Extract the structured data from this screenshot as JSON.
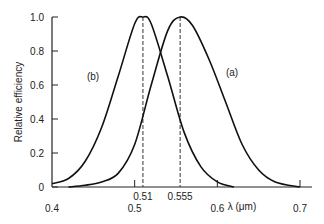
{
  "chart_data": {
    "type": "line",
    "title": "",
    "xlabel": "λ (μm)",
    "ylabel": "Relative efficiency",
    "xlim": [
      0.4,
      0.7
    ],
    "ylim": [
      0,
      1.0
    ],
    "grid": false,
    "x_ticks": [
      {
        "value": 0.4,
        "label": "0.4"
      },
      {
        "value": 0.5,
        "label": "0.5"
      },
      {
        "value": 0.6,
        "label": "0.6"
      },
      {
        "value": 0.7,
        "label": "0.7"
      }
    ],
    "y_ticks": [
      {
        "value": 0,
        "label": "0"
      },
      {
        "value": 0.2,
        "label": "0.2"
      },
      {
        "value": 0.4,
        "label": "0.4"
      },
      {
        "value": 0.6,
        "label": "0.6"
      },
      {
        "value": 0.8,
        "label": "0.8"
      },
      {
        "value": 1.0,
        "label": "1.0"
      }
    ],
    "annotations": [
      {
        "type": "dashed-vline",
        "x": 0.51,
        "label": "0.51"
      },
      {
        "type": "dashed-vline",
        "x": 0.555,
        "label": "0.555"
      }
    ],
    "series": [
      {
        "name": "(b)",
        "peak": 0.51,
        "x": [
          0.4,
          0.42,
          0.44,
          0.46,
          0.48,
          0.5,
          0.51,
          0.52,
          0.54,
          0.56,
          0.58,
          0.6,
          0.62
        ],
        "values": [
          0.02,
          0.05,
          0.15,
          0.35,
          0.65,
          0.96,
          1.0,
          0.96,
          0.65,
          0.32,
          0.12,
          0.03,
          0.0
        ]
      },
      {
        "name": "(a)",
        "peak": 0.555,
        "x": [
          0.42,
          0.44,
          0.46,
          0.48,
          0.5,
          0.52,
          0.54,
          0.555,
          0.57,
          0.59,
          0.61,
          0.63,
          0.65,
          0.67,
          0.7
        ],
        "values": [
          0.0,
          0.01,
          0.03,
          0.08,
          0.25,
          0.6,
          0.92,
          1.0,
          0.95,
          0.75,
          0.5,
          0.25,
          0.1,
          0.03,
          0.0
        ]
      }
    ]
  }
}
